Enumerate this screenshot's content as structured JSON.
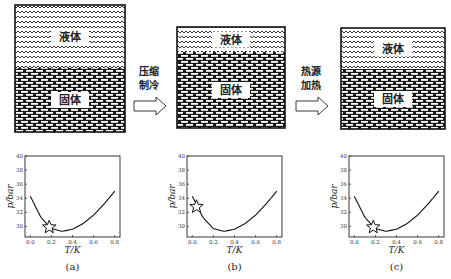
{
  "panels": [
    {
      "id": "a",
      "caption": "(a)",
      "container": {
        "x": 15,
        "y": 5,
        "w": 110,
        "h": 127,
        "boundary_y": 68
      },
      "liquid_label": "液体",
      "solid_label": "固体",
      "plot": {
        "x": 25,
        "y": 156,
        "w": 95,
        "h": 81,
        "star": {
          "T": 0.18,
          "p": 29.9
        }
      }
    },
    {
      "id": "b",
      "caption": "(b)",
      "container": {
        "x": 177,
        "y": 27,
        "w": 108,
        "h": 101,
        "boundary_y": 52
      },
      "liquid_label": "液体",
      "solid_label": "固体",
      "plot": {
        "x": 187,
        "y": 156,
        "w": 95,
        "h": 81,
        "star": {
          "T": 0.04,
          "p": 32.8
        }
      }
    },
    {
      "id": "c",
      "caption": "(c)",
      "container": {
        "x": 341,
        "y": 28,
        "w": 104,
        "h": 101,
        "boundary_y": 69
      },
      "liquid_label": "液体",
      "solid_label": "固体",
      "plot": {
        "x": 349,
        "y": 156,
        "w": 95,
        "h": 81,
        "star": {
          "T": 0.18,
          "p": 29.9
        }
      }
    }
  ],
  "arrows": [
    {
      "label_line1": "压缩",
      "label_line2": "制冷",
      "x": 134,
      "y": 93
    },
    {
      "label_line1": "热源",
      "label_line2": "加热",
      "x": 296,
      "y": 93
    }
  ],
  "chart_data": [
    {
      "type": "line",
      "title": "(a)",
      "xlabel": "T/K",
      "ylabel": "p/bar",
      "xlim": [
        -0.05,
        0.85
      ],
      "ylim": [
        28.5,
        40
      ],
      "xticks": [
        "0.0",
        "0.2",
        "0.4",
        "0.6",
        "0.8"
      ],
      "yticks": [
        "30",
        "32",
        "34",
        "36",
        "38",
        "40"
      ],
      "series": [
        {
          "name": "melting curve",
          "x": [
            0.0,
            0.1,
            0.2,
            0.3,
            0.4,
            0.5,
            0.6,
            0.7,
            0.8
          ],
          "y": [
            34.3,
            31.3,
            29.7,
            29.3,
            29.6,
            30.4,
            31.6,
            33.2,
            35.0
          ]
        }
      ],
      "marker": {
        "shape": "star",
        "x": 0.18,
        "y": 29.9
      }
    },
    {
      "type": "line",
      "title": "(b)",
      "xlabel": "T/K",
      "ylabel": "p/bar",
      "xlim": [
        -0.05,
        0.85
      ],
      "ylim": [
        28.5,
        40
      ],
      "xticks": [
        "0.0",
        "0.2",
        "0.4",
        "0.6",
        "0.8"
      ],
      "yticks": [
        "30",
        "32",
        "34",
        "36",
        "38",
        "40"
      ],
      "series": [
        {
          "name": "melting curve",
          "x": [
            0.0,
            0.1,
            0.2,
            0.3,
            0.4,
            0.5,
            0.6,
            0.7,
            0.8
          ],
          "y": [
            34.3,
            31.3,
            29.7,
            29.3,
            29.6,
            30.4,
            31.6,
            33.2,
            35.0
          ]
        }
      ],
      "marker": {
        "shape": "star",
        "x": 0.04,
        "y": 32.8
      }
    },
    {
      "type": "line",
      "title": "(c)",
      "xlabel": "T/K",
      "ylabel": "p/bar",
      "xlim": [
        -0.05,
        0.85
      ],
      "ylim": [
        28.5,
        40
      ],
      "xticks": [
        "0.0",
        "0.2",
        "0.4",
        "0.6",
        "0.8"
      ],
      "yticks": [
        "30",
        "32",
        "34",
        "36",
        "38",
        "40"
      ],
      "series": [
        {
          "name": "melting curve",
          "x": [
            0.0,
            0.1,
            0.2,
            0.3,
            0.4,
            0.5,
            0.6,
            0.7,
            0.8
          ],
          "y": [
            34.3,
            31.3,
            29.7,
            29.3,
            29.6,
            30.4,
            31.6,
            33.2,
            35.0
          ]
        }
      ],
      "marker": {
        "shape": "star",
        "x": 0.18,
        "y": 29.9
      }
    }
  ]
}
